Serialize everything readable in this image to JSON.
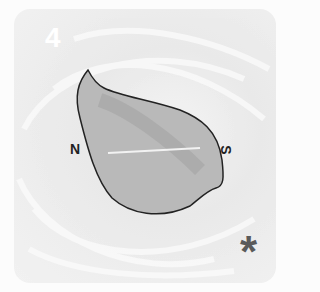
{
  "card": {
    "number": "4",
    "north_label": "N",
    "south_label": "S",
    "corner_symbol": "*"
  },
  "colors": {
    "leaf_fill": "#b8b8b8",
    "leaf_stroke": "#222222",
    "number_color": "#ffffff",
    "symbol_color": "#5a5a5a"
  }
}
